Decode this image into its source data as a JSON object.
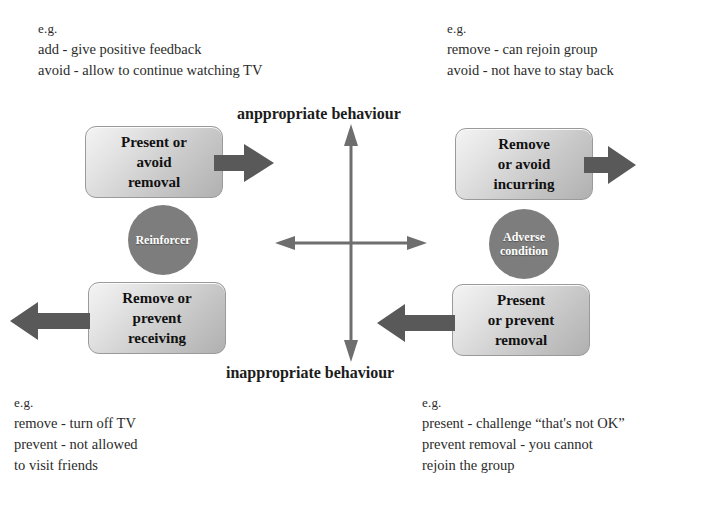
{
  "diagram": {
    "axis": {
      "top_label": "anppropriate behaviour",
      "bottom_label": "inappropriate behaviour"
    },
    "colors": {
      "arrow": "#595959",
      "cross": "#6e6e6e",
      "circle_fill": "#7d7d7d",
      "box_border": "#9a9a9a",
      "text": "#1a1a1a"
    },
    "boxes": {
      "top_left": {
        "line1": "Present or",
        "line2": "avoid",
        "line3": "removal"
      },
      "top_right": {
        "line1": "Remove",
        "line2": "or avoid",
        "line3": "incurring"
      },
      "bottom_left": {
        "line1": "Remove or",
        "line2": "prevent",
        "line3": "receiving"
      },
      "bottom_right": {
        "line1": "Present",
        "line2": "or prevent",
        "line3": "removal"
      }
    },
    "circles": {
      "left": {
        "line1": "Reinforcer",
        "line2": ""
      },
      "right": {
        "line1": "Adverse",
        "line2": "condition"
      }
    },
    "examples": {
      "top_left": {
        "head": "e.g.",
        "line1": "add - give positive feedback",
        "line2": "avoid - allow to continue watching TV",
        "line3": "",
        "line4": ""
      },
      "top_right": {
        "head": "e.g.",
        "line1": "remove - can rejoin group",
        "line2": "avoid - not have to stay back",
        "line3": "",
        "line4": ""
      },
      "bottom_left": {
        "head": "e.g.",
        "line1": "remove - turn off TV",
        "line2": "prevent - not allowed",
        "line3": "to visit friends",
        "line4": ""
      },
      "bottom_right": {
        "head": "e.g.",
        "line1": "present - challenge “that's not OK”",
        "line2": "prevent removal - you cannot",
        "line3": "rejoin the group",
        "line4": ""
      }
    },
    "arrows": {
      "top_left_direction": "right",
      "top_right_direction": "right",
      "bottom_left_direction": "left",
      "bottom_right_direction": "left",
      "center_vertical": "double-headed",
      "center_horizontal": "double-headed"
    }
  }
}
